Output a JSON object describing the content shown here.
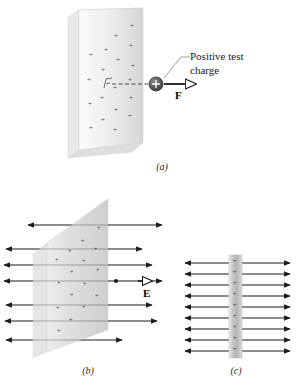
{
  "figure": {
    "panels": [
      {
        "id": "a",
        "label": "(a)",
        "description": "Charged sheet in perspective with positive test charge experiencing force F",
        "callout": {
          "line1": "Positive test",
          "line2": "charge"
        },
        "vector_label": "F",
        "charge_symbol": "+"
      },
      {
        "id": "b",
        "label": "(b)",
        "description": "Charged sheet in perspective with electric field lines pointing away on both sides",
        "vector_label": "E",
        "field_rows": 7
      },
      {
        "id": "c",
        "label": "(c)",
        "description": "Edge-on view of charged sheet with uniform field lines both directions",
        "field_rows": 9
      }
    ]
  },
  "colors": {
    "background": "#ffffff",
    "plate_light": "#f2f2f2",
    "plate_mid": "#d8d8d8",
    "plate_dark": "#b8b8b8",
    "plate_edge": "#e8e8e8",
    "line": "#1a1a1a",
    "charge_fill": "#555555",
    "text": "#1a1a1a",
    "plus_mark": "#4a4a4a"
  }
}
